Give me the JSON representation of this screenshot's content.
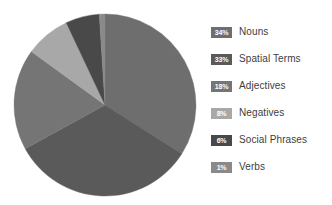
{
  "chart_data": {
    "type": "pie",
    "title": "",
    "subtitle": "",
    "xlabel": "",
    "ylabel": "",
    "legend_position": "right",
    "grid": false,
    "units": "percent",
    "total": 100,
    "categories": [
      "Nouns",
      "Spatial Terms",
      "Adjectives",
      "Negatives",
      "Social Phrases",
      "Verbs"
    ],
    "values": [
      34,
      33,
      18,
      8,
      6,
      1
    ],
    "value_labels": [
      "34%",
      "33%",
      "18%",
      "8%",
      "6%",
      "1%"
    ],
    "colors": [
      "#6e6e6e",
      "#5a5a5a",
      "#757575",
      "#a8a8a8",
      "#494949",
      "#8a8a8a"
    ],
    "start_angle_deg": 0,
    "direction": "clockwise",
    "slices": [
      {
        "label": "Nouns",
        "value": 34,
        "value_label": "34%",
        "color": "#6e6e6e"
      },
      {
        "label": "Spatial Terms",
        "value": 33,
        "value_label": "33%",
        "color": "#5a5a5a"
      },
      {
        "label": "Adjectives",
        "value": 18,
        "value_label": "18%",
        "color": "#757575"
      },
      {
        "label": "Negatives",
        "value": 8,
        "value_label": "8%",
        "color": "#a8a8a8"
      },
      {
        "label": "Social Phrases",
        "value": 6,
        "value_label": "6%",
        "color": "#494949"
      },
      {
        "label": "Verbs",
        "value": 1,
        "value_label": "1%",
        "color": "#8a8a8a"
      }
    ]
  },
  "figure": {
    "background": "#ffffff",
    "pie": {
      "center_x": 92,
      "center_y": 92,
      "radius": 91
    }
  },
  "legend": {
    "items": [
      {
        "pct": "34%",
        "label": "Nouns",
        "swatch_color": "#6e6e6e"
      },
      {
        "pct": "33%",
        "label": "Spatial Terms",
        "swatch_color": "#5a5a5a"
      },
      {
        "pct": "18%",
        "label": "Adjectives",
        "swatch_color": "#757575"
      },
      {
        "pct": "8%",
        "label": "Negatives",
        "swatch_color": "#a8a8a8"
      },
      {
        "pct": "6%",
        "label": "Social Phrases",
        "swatch_color": "#494949"
      },
      {
        "pct": "1%",
        "label": "Verbs",
        "swatch_color": "#8a8a8a"
      }
    ]
  }
}
